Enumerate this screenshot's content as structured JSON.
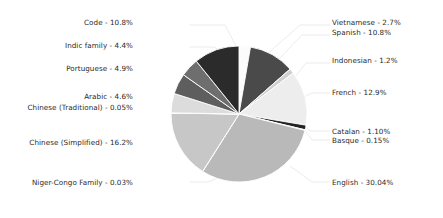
{
  "chart_data": {
    "type": "pie",
    "title": "",
    "subtitle": "",
    "xlabel": "",
    "ylabel": "",
    "legend_position": "labels-with-leader-lines",
    "grid": false,
    "start_angle_deg": 90,
    "direction": "clockwise",
    "categories": [
      "Vietnamese",
      "Spanish",
      "Indonesian",
      "French",
      "Catalan",
      "Basque",
      "English",
      "Niger-Congo Family",
      "Chinese (Simplified)",
      "Chinese (Traditional)",
      "Arabic",
      "Portuguese",
      "Indic family",
      "Code"
    ],
    "values": [
      2.7,
      10.8,
      1.2,
      12.9,
      1.1,
      0.15,
      30.04,
      0.03,
      16.2,
      0.05,
      4.6,
      4.9,
      4.4,
      10.8
    ],
    "value_unit": "%",
    "colors": [
      "#fbfbfb",
      "#4a4a4a",
      "#d0d0d0",
      "#ededed",
      "#242424",
      "#6a6a6a",
      "#b9b9b9",
      "#5a5a5a",
      "#c7c7c7",
      "#2e2e2e",
      "#dcdcdc",
      "#5e5e5e",
      "#6e6e6e",
      "#2b2b2b"
    ],
    "slice_labels": [
      "Vietnamese - 2.7%",
      "Spanish - 10.8%",
      "Indonesian - 1.2%",
      "French - 12.9%",
      "Catalan - 1.10%",
      "Basque - 0.15%",
      "English - 30.04%",
      "Niger-Congo Family - 0.03%",
      "Chinese (Simplified) - 16.2%",
      "Chinese (Traditional) - 0.05%",
      "Arabic - 4.6%",
      "Portuguese - 4.9%",
      "Indic family - 4.4%",
      "Code - 10.8%"
    ]
  },
  "labels": {
    "code": "Code - 10.8%",
    "indic_family": "Indic family - 4.4%",
    "portuguese": "Portuguese - 4.9%",
    "arabic": "Arabic - 4.6%",
    "chinese_traditional": "Chinese (Traditional) - 0.05%",
    "chinese_simplified": "Chinese (Simplified) - 16.2%",
    "niger_congo": "Niger-Congo Family - 0.03%",
    "vietnamese": "Vietnamese - 2.7%",
    "spanish": "Spanish - 10.8%",
    "indonesian": "Indonesian - 1.2%",
    "french": "French - 12.9%",
    "catalan": "Catalan - 1.10%",
    "basque": "Basque - 0.15%",
    "english": "English - 30.04%"
  }
}
